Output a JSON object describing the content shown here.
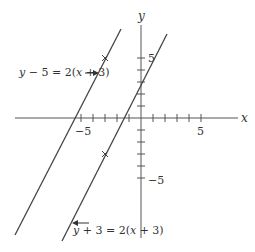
{
  "graph": {
    "axes": {
      "x_label": "x",
      "y_label": "y",
      "x_ticks": [
        -5,
        -4,
        -3,
        -2,
        -1,
        1,
        2,
        3,
        4,
        5
      ],
      "y_ticks": [
        -5,
        -4,
        -3,
        -2,
        -1,
        1,
        2,
        3,
        4,
        5
      ],
      "x_tick_labels": {
        "neg": "−5",
        "pos": "5"
      },
      "y_tick_labels": {
        "neg": "−5",
        "pos": "5"
      }
    },
    "lines": [
      {
        "name": "line-1",
        "equation": "y − 5 = 2(x + 3)",
        "slope": 2,
        "point": [
          -3,
          5
        ],
        "marker": "x"
      },
      {
        "name": "line-2",
        "equation": "y + 3 = 2(x + 3)",
        "slope": 2,
        "point": [
          -3,
          -3
        ],
        "marker": "x"
      }
    ],
    "colors": {
      "line": "#444444",
      "axis": "#555555",
      "text": "#333333"
    }
  }
}
